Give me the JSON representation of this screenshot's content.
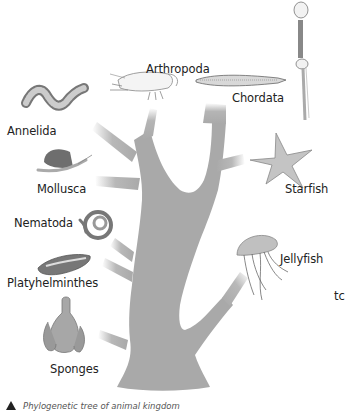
{
  "figure": {
    "title": "Phylogenetic tree of animal kingdom",
    "caption": "Phylogenetic tree of animal kingdom",
    "stray_text": "tc",
    "colors": {
      "tree": "#a9a9a9",
      "text": "#222222",
      "caption": "#555555"
    },
    "groups": [
      {
        "id": "arthropoda",
        "label": "Arthropoda",
        "illustration": "shrimp"
      },
      {
        "id": "chordata",
        "label": "Chordata",
        "illustration": "lancelet-and-human-skeleton"
      },
      {
        "id": "annelida",
        "label": "Annelida",
        "illustration": "segmented-worm"
      },
      {
        "id": "mollusca",
        "label": "Mollusca",
        "illustration": "snail"
      },
      {
        "id": "starfish",
        "label": "Starfish",
        "illustration": "starfish"
      },
      {
        "id": "nematoda",
        "label": "Nematoda",
        "illustration": "roundworm"
      },
      {
        "id": "jellyfish",
        "label": "Jellyfish",
        "illustration": "jellyfish"
      },
      {
        "id": "platyhelminthes",
        "label": "Platyhelminthes",
        "illustration": "flatworm"
      },
      {
        "id": "sponges",
        "label": "Sponges",
        "illustration": "sponge"
      }
    ]
  }
}
